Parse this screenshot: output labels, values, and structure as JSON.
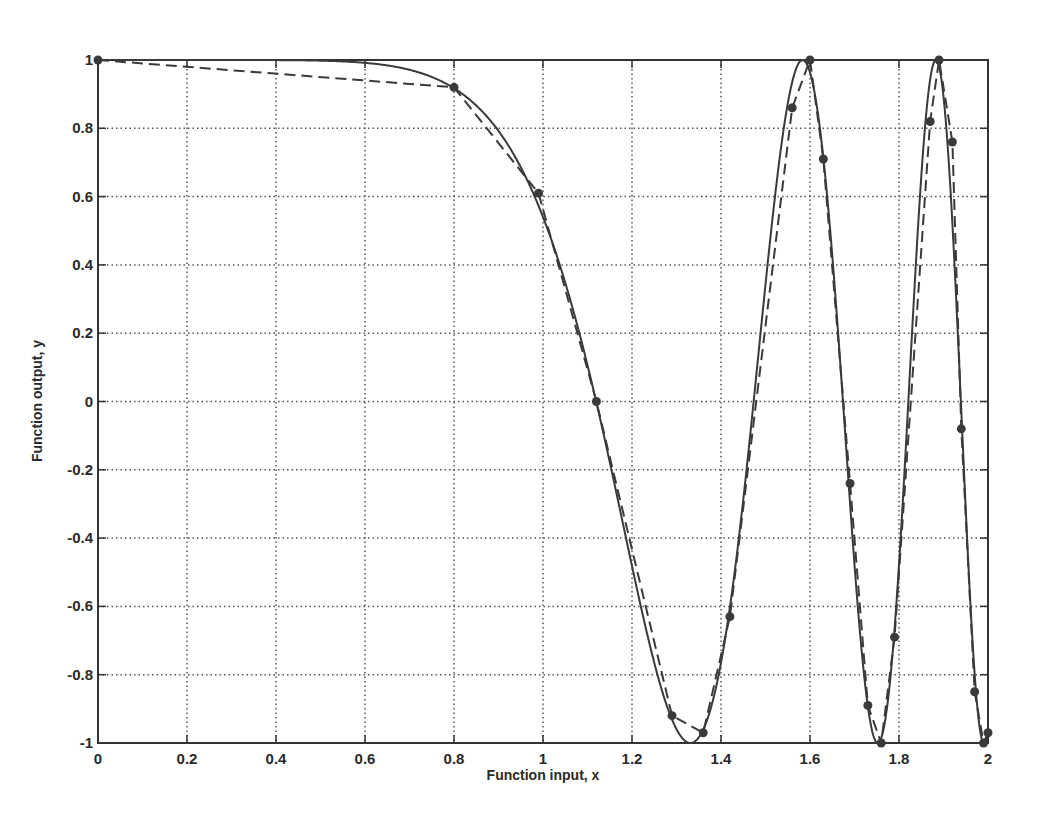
{
  "chart_data": {
    "type": "line",
    "title": "",
    "xlabel": "Function input, x",
    "ylabel": "Function output, y",
    "xlim": [
      0,
      2
    ],
    "ylim": [
      -1,
      1
    ],
    "grid": true,
    "legend": null,
    "xticks": [
      "0",
      "0.2",
      "0.4",
      "0.6",
      "0.8",
      "1",
      "1.2",
      "1.4",
      "1.6",
      "1.8",
      "2"
    ],
    "yticks": [
      "1",
      "0.8",
      "0.6",
      "0.4",
      "0.2",
      "0",
      "-0.2",
      "-0.4",
      "-0.6",
      "-0.8",
      "-1"
    ],
    "series": [
      {
        "name": "Function (solid)",
        "style": "solid",
        "expression": "y = cos(x^4)",
        "x": [
          0,
          0.1,
          0.2,
          0.3,
          0.4,
          0.5,
          0.55,
          0.6,
          0.65,
          0.7,
          0.75,
          0.8,
          0.85,
          0.9,
          0.95,
          1.0,
          1.05,
          1.1,
          1.15,
          1.2,
          1.25,
          1.28,
          1.31,
          1.33,
          1.35,
          1.38,
          1.41,
          1.44,
          1.47,
          1.5,
          1.53,
          1.56,
          1.58,
          1.6,
          1.62,
          1.64,
          1.66,
          1.68,
          1.7,
          1.72,
          1.74,
          1.76,
          1.78,
          1.8,
          1.82,
          1.84,
          1.86,
          1.88,
          1.89,
          1.9,
          1.91,
          1.92,
          1.93,
          1.94,
          1.95,
          1.96,
          1.97,
          1.98,
          1.99,
          2.0
        ],
        "y": [
          1.0,
          1.0,
          1.0,
          1.0,
          1.0,
          1.0,
          0.9996,
          0.9991,
          0.9982,
          0.9971,
          0.9898,
          0.9183,
          0.8466,
          0.7996,
          0.6955,
          0.5403,
          0.3423,
          0.1102,
          -0.1422,
          -0.4036,
          -0.6619,
          -0.8041,
          -0.9205,
          -0.9756,
          -0.9997,
          -0.9687,
          -0.8621,
          -0.6661,
          -0.4001,
          -0.0804,
          0.2659,
          0.5994,
          0.7887,
          0.9383,
          0.9993,
          0.9538,
          0.8014,
          0.544,
          0.2022,
          -0.1841,
          -0.5654,
          -0.8692,
          -0.9983,
          -0.9225,
          -0.6502,
          -0.2186,
          0.2822,
          0.7338,
          0.9023,
          0.9876,
          0.9921,
          0.8912,
          0.6857,
          0.3946,
          0.0544,
          -0.2998,
          -0.6209,
          -0.8629,
          -0.9874,
          -0.9577
        ]
      },
      {
        "name": "Sampled points (dashed)",
        "style": "dashed",
        "markers": true,
        "x": [
          0.0,
          0.8,
          0.99,
          1.12,
          1.29,
          1.36,
          1.42,
          1.56,
          1.6,
          1.63,
          1.69,
          1.73,
          1.76,
          1.79,
          1.87,
          1.89,
          1.92,
          1.94,
          1.97,
          1.99,
          2.0
        ],
        "y": [
          1.0,
          0.92,
          0.61,
          0.0,
          -0.92,
          -0.97,
          -0.63,
          0.86,
          1.0,
          0.71,
          -0.24,
          -0.89,
          -1.0,
          -0.69,
          0.82,
          1.0,
          0.76,
          -0.08,
          -0.85,
          -1.0,
          -0.97
        ]
      }
    ]
  },
  "colors": {
    "line": "#3a3a3a",
    "grid": "#555555",
    "axis": "#333333",
    "background": "#ffffff"
  }
}
